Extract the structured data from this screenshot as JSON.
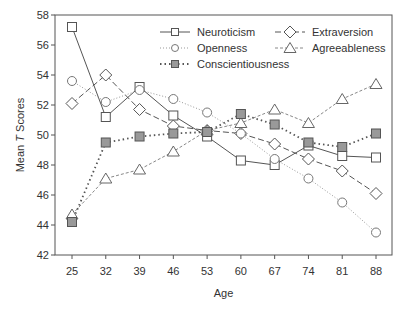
{
  "chart_data": {
    "type": "line",
    "title": "",
    "xlabel": "Age",
    "ylabel": "Mean T Scores",
    "ylabel_parts": [
      "Mean ",
      "T",
      " Scores"
    ],
    "x": [
      25,
      32,
      39,
      46,
      53,
      60,
      67,
      74,
      81,
      88
    ],
    "x_tick_labels": [
      "25",
      "32",
      "39",
      "46",
      "53",
      "60",
      "67",
      "74",
      "81",
      "88"
    ],
    "y_ticks": [
      42,
      44,
      46,
      48,
      50,
      52,
      54,
      56,
      58
    ],
    "y_tick_labels": [
      "42",
      "44",
      "46",
      "48",
      "50",
      "52",
      "54",
      "56",
      "58"
    ],
    "ylim": [
      42,
      58
    ],
    "grid": false,
    "legend_position": "upper right (inside)",
    "series": [
      {
        "name": "Neuroticism",
        "marker": "square-open",
        "line": "solid",
        "color": "#555555",
        "values": [
          57.2,
          51.2,
          53.2,
          51.3,
          49.9,
          48.3,
          48.0,
          49.3,
          48.6,
          48.5
        ]
      },
      {
        "name": "Extraversion",
        "marker": "diamond-open",
        "line": "dashed",
        "color": "#555555",
        "values": [
          52.1,
          54.0,
          51.7,
          50.6,
          50.3,
          50.1,
          49.4,
          48.4,
          47.6,
          46.1
        ]
      },
      {
        "name": "Openness",
        "marker": "circle-open",
        "line": "dotted-fine",
        "color": "#999999",
        "values": [
          53.6,
          52.2,
          53.0,
          52.4,
          51.5,
          50.1,
          48.4,
          47.1,
          45.5,
          43.5
        ]
      },
      {
        "name": "Agreeableness",
        "marker": "triangle-open",
        "line": "dash-dot-fine",
        "color": "#888888",
        "values": [
          44.7,
          47.1,
          47.7,
          48.9,
          50.3,
          50.8,
          51.7,
          50.8,
          52.4,
          53.4
        ]
      },
      {
        "name": "Conscientiousness",
        "marker": "square-filled",
        "line": "dotted",
        "color": "#555555",
        "fill": "#999999",
        "values": [
          44.2,
          49.5,
          49.9,
          50.1,
          50.2,
          51.4,
          50.7,
          49.5,
          49.2,
          50.1
        ]
      }
    ],
    "legend": [
      {
        "label": "Neuroticism",
        "col": 0,
        "row": 0
      },
      {
        "label": "Extraversion",
        "col": 1,
        "row": 0
      },
      {
        "label": "Openness",
        "col": 0,
        "row": 1
      },
      {
        "label": "Agreeableness",
        "col": 1,
        "row": 1
      },
      {
        "label": "Conscientiousness",
        "col": 0,
        "row": 2
      }
    ]
  },
  "layout": {
    "plot": {
      "left": 55,
      "top": 15,
      "right": 392,
      "bottom": 255
    },
    "x_first_px": 72,
    "x_last_px": 376
  }
}
